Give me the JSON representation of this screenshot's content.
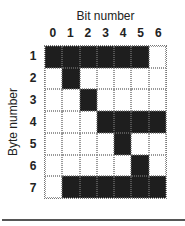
{
  "title": "Bit number",
  "ylabel": "Byte number",
  "columns": [
    "0",
    "1",
    "2",
    "3",
    "4",
    "5",
    "6"
  ],
  "rows": [
    "1",
    "2",
    "3",
    "4",
    "5",
    "6",
    "7"
  ],
  "colors": {
    "on": "#1e1e1e",
    "off": "#ffffff"
  },
  "grid": [
    [
      1,
      1,
      1,
      1,
      1,
      1,
      0
    ],
    [
      0,
      1,
      0,
      0,
      0,
      0,
      0
    ],
    [
      0,
      0,
      1,
      0,
      0,
      0,
      0
    ],
    [
      0,
      0,
      0,
      1,
      1,
      1,
      1
    ],
    [
      0,
      0,
      0,
      0,
      1,
      0,
      0
    ],
    [
      0,
      0,
      0,
      0,
      0,
      1,
      0
    ],
    [
      0,
      1,
      1,
      1,
      1,
      1,
      1
    ]
  ]
}
